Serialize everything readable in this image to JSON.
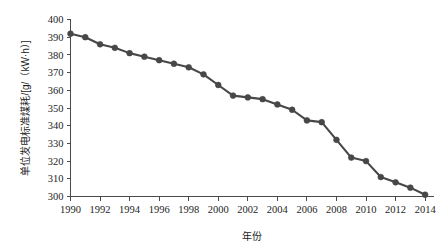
{
  "chart_data": {
    "type": "line",
    "title": "",
    "xlabel": "年份",
    "ylabel": "单位发电标准煤耗/[g/（kW·h）]",
    "xlim": [
      1990,
      2014.6
    ],
    "ylim": [
      300,
      400
    ],
    "grid": false,
    "legend": null,
    "x_tick_labels": [
      "1990",
      "1992",
      "1994",
      "1996",
      "1998",
      "2000",
      "2002",
      "2004",
      "2006",
      "2008",
      "2010",
      "2012",
      "2014"
    ],
    "x_ticks": [
      1990,
      1992,
      1994,
      1996,
      1998,
      2000,
      2002,
      2004,
      2006,
      2008,
      2010,
      2012,
      2014
    ],
    "y_tick_labels": [
      "300",
      "310",
      "320",
      "330",
      "340",
      "350",
      "360",
      "370",
      "380",
      "390",
      "400"
    ],
    "y_ticks": [
      300,
      310,
      320,
      330,
      340,
      350,
      360,
      370,
      380,
      390,
      400
    ],
    "x": [
      1990,
      1991,
      1992,
      1993,
      1994,
      1995,
      1996,
      1997,
      1998,
      1999,
      2000,
      2001,
      2002,
      2003,
      2004,
      2005,
      2006,
      2007,
      2008,
      2009,
      2010,
      2011,
      2012,
      2013,
      2014
    ],
    "values": [
      392,
      390,
      386,
      384,
      381,
      379,
      377,
      375,
      373,
      369,
      363,
      357,
      356,
      355,
      352,
      349,
      343,
      342,
      332,
      322,
      320,
      311,
      308,
      305,
      301
    ],
    "series": [
      {
        "name": "单位发电标准煤耗",
        "values": [
          392,
          390,
          386,
          384,
          381,
          379,
          377,
          375,
          373,
          369,
          363,
          357,
          356,
          355,
          352,
          349,
          343,
          342,
          332,
          322,
          320,
          311,
          308,
          305,
          301
        ],
        "color": "#474747",
        "marker": "circle"
      }
    ]
  },
  "colors": {
    "line": "#474747",
    "marker": "#474747",
    "axis": "#4a4a4a",
    "text": "#1d1d1d",
    "background": "#ffffff"
  }
}
